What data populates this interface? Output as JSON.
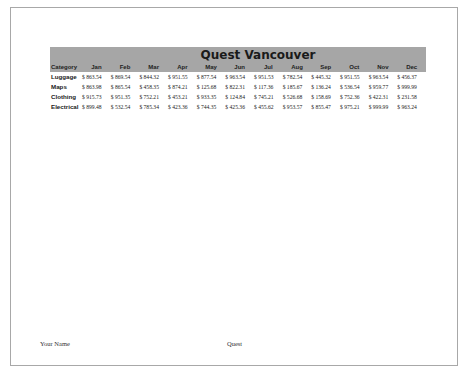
{
  "sheet": {
    "title": "Quest Vancouver",
    "columns": [
      "Category",
      "Jan",
      "Feb",
      "Mar",
      "Apr",
      "May",
      "Jun",
      "Jul",
      "Aug",
      "Sep",
      "Oct",
      "Nov",
      "Dec"
    ],
    "rows": [
      {
        "category": "Luggage",
        "values": [
          "$ 863.54",
          "$ 869.54",
          "$ 844.32",
          "$ 951.55",
          "$ 877.54",
          "$ 963.54",
          "$ 951.53",
          "$ 782.54",
          "$ 445.32",
          "$ 951.55",
          "$ 963.54",
          "$ 456.37"
        ]
      },
      {
        "category": "Maps",
        "values": [
          "$ 863.98",
          "$ 865.54",
          "$ 458.35",
          "$ 874.21",
          "$ 125.68",
          "$ 822.31",
          "$ 117.36",
          "$ 185.67",
          "$ 136.24",
          "$ 536.54",
          "$ 959.77",
          "$ 999.99"
        ]
      },
      {
        "category": "Clothing",
        "values": [
          "$ 915.73",
          "$ 951.35",
          "$ 752.21",
          "$ 453.21",
          "$ 933.35",
          "$ 124.84",
          "$ 745.21",
          "$ 526.68",
          "$ 158.69",
          "$ 752.36",
          "$ 422.31",
          "$ 231.58"
        ]
      },
      {
        "category": "Electrical",
        "values": [
          "$ 899.48",
          "$ 532.54",
          "$ 785.34",
          "$ 423.36",
          "$ 744.35",
          "$ 425.36",
          "$ 455.62",
          "$ 953.57",
          "$ 855.47",
          "$ 975.21",
          "$ 999.99",
          "$ 963.24"
        ]
      }
    ]
  },
  "footer": {
    "left": "Your Name",
    "center": "Quest"
  },
  "colors": {
    "header_band": "#a6a6a6",
    "page_border": "#a8a8a8"
  }
}
